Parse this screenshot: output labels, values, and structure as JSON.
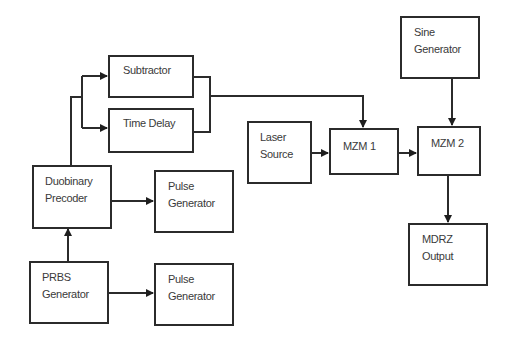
{
  "diagram": {
    "type": "block-diagram",
    "blocks": {
      "subtractor": {
        "label": "Subtractor"
      },
      "time_delay": {
        "label": "Time Delay"
      },
      "duobinary": {
        "line1": "Duobinary",
        "line2": "Precoder"
      },
      "pulse_gen_1": {
        "line1": "Pulse",
        "line2": "Generator"
      },
      "prbs": {
        "line1": "PRBS",
        "line2": "Generator"
      },
      "pulse_gen_2": {
        "line1": "Pulse",
        "line2": "Generator"
      },
      "laser": {
        "line1": "Laser",
        "line2": "Source"
      },
      "mzm1": {
        "label": "MZM 1"
      },
      "mzm2": {
        "label": "MZM 2"
      },
      "sine": {
        "line1": "Sine",
        "line2": "Generator"
      },
      "mdrz": {
        "line1": "MDRZ",
        "line2": "Output"
      }
    },
    "connections": [
      {
        "from": "PRBS Generator",
        "to": "Duobinary Precoder"
      },
      {
        "from": "PRBS Generator",
        "to": "Pulse Generator (bottom)"
      },
      {
        "from": "Duobinary Precoder",
        "to": "Pulse Generator (top)"
      },
      {
        "from": "Duobinary Precoder",
        "to": "Subtractor"
      },
      {
        "from": "Duobinary Precoder",
        "to": "Time Delay"
      },
      {
        "from": "Subtractor + Time Delay",
        "to": "MZM 1"
      },
      {
        "from": "Laser Source",
        "to": "MZM 1"
      },
      {
        "from": "MZM 1",
        "to": "MZM 2"
      },
      {
        "from": "Sine Generator",
        "to": "MZM 2"
      },
      {
        "from": "MZM 2",
        "to": "MDRZ Output"
      }
    ]
  }
}
